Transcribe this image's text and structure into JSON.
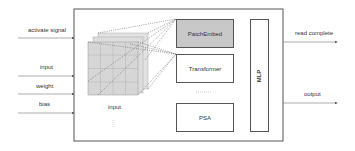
{
  "diagram": {
    "inputs": [
      {
        "label": "activate signal",
        "y": 38
      },
      {
        "label": "input",
        "y": 76
      },
      {
        "label": "weight",
        "y": 94
      },
      {
        "label": "bias",
        "y": 113
      }
    ],
    "outputs": [
      {
        "label": "read complete",
        "y": 42
      },
      {
        "label": "output",
        "y": 103
      }
    ],
    "grid_label": "input",
    "modules": {
      "patch_embed": "PatchEmbed",
      "transformer": "Transformer",
      "ellipsis": ".....",
      "psa": "PSA",
      "mlp": "MLP"
    },
    "colors": {
      "line": "#555555",
      "patch_embed_fill": "#c8c8c8",
      "grid_fill": "#d8d8d8",
      "text": "#333333"
    }
  }
}
